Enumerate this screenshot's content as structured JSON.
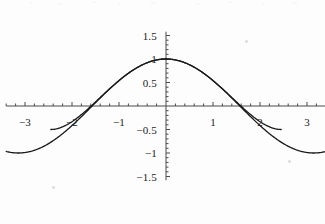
{
  "chart_data": {
    "type": "line",
    "title": "",
    "subtitle": "",
    "xlabel": "",
    "ylabel": "",
    "xlim": [
      -3.4,
      3.4
    ],
    "ylim": [
      -1.58,
      1.58
    ],
    "grid": false,
    "legend": "none",
    "axis_style": "crossing-at-origin",
    "x_ticks": [
      -3,
      -2,
      -1,
      1,
      2,
      3
    ],
    "x_tick_labels": [
      "-3",
      "-2",
      "-1",
      "1",
      "2",
      "3"
    ],
    "y_ticks": [
      -1.5,
      -1,
      -0.5,
      1,
      1.5
    ],
    "y_tick_labels": [
      "-1.5",
      "-1",
      "-0.5",
      "1",
      "1.5"
    ],
    "y_tick_labels_extra": [
      "0.5"
    ],
    "minor_tick_step_x": 0.2,
    "minor_tick_step_y": 0.1,
    "series": [
      {
        "name": "cos(x)",
        "expression": "cos(x)",
        "color": "#1a1a1a",
        "width": 1.3,
        "points_x": [
          -3.4,
          -3.2,
          -3.0,
          -2.8,
          -2.6,
          -2.4,
          -2.2,
          -2.0,
          -1.8,
          -1.6,
          -1.4,
          -1.2,
          -1.0,
          -0.8,
          -0.6,
          -0.4,
          -0.2,
          0.0,
          0.2,
          0.4,
          0.6,
          0.8,
          1.0,
          1.2,
          1.4,
          1.6,
          1.8,
          2.0,
          2.2,
          2.4,
          2.6,
          2.8,
          3.0,
          3.2,
          3.4
        ],
        "points_y": [
          -0.967,
          -0.998,
          -0.99,
          -0.942,
          -0.857,
          -0.737,
          -0.589,
          -0.416,
          -0.227,
          -0.029,
          0.17,
          0.362,
          0.54,
          0.697,
          0.825,
          0.921,
          0.98,
          1.0,
          0.98,
          0.921,
          0.825,
          0.697,
          0.54,
          0.362,
          0.17,
          -0.029,
          -0.227,
          -0.416,
          -0.589,
          -0.737,
          -0.857,
          -0.942,
          -0.99,
          -0.998,
          -0.967
        ]
      },
      {
        "name": "Taylor approximation",
        "expression": "1 - x^2/2 + x^4/24",
        "color": "#1a1a1a",
        "width": 1.3,
        "points_x": [
          -2.3,
          -2.2,
          -2.1,
          -2.0,
          -1.8,
          -1.6,
          -1.4,
          -1.2,
          -1.0,
          -0.8,
          -0.6,
          -0.4,
          -0.2,
          0.0,
          0.2,
          0.4,
          0.6,
          0.8,
          1.0,
          1.2,
          1.4,
          1.6,
          1.8,
          2.0,
          2.1,
          2.2,
          2.3
        ],
        "points_y": [
          -1.49,
          -1.26,
          -1.0,
          -0.72,
          -0.17,
          0.25,
          0.14,
          0.39,
          0.542,
          0.701,
          0.825,
          0.921,
          0.98,
          1.0,
          0.98,
          0.921,
          0.825,
          0.701,
          0.542,
          0.39,
          0.14,
          0.25,
          -0.17,
          -0.72,
          -1.0,
          -1.26,
          -1.49
        ]
      }
    ],
    "peak": {
      "x": 0,
      "y": 1.0
    },
    "zero_crossings": [
      -1.571,
      1.571
    ]
  },
  "colors": {
    "curve": "#1a1a1a",
    "axis": "#4a4a4a",
    "background": "#fdfdfd",
    "text": "#1a1a1a"
  },
  "axis": {
    "x_axis_name": "horizontal-axis",
    "y_axis_name": "vertical-axis"
  }
}
